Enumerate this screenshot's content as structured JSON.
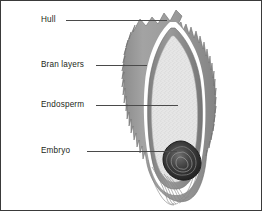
{
  "figure": {
    "frame_color": "#3a3a3a",
    "background": "#ffffff"
  },
  "labels": [
    {
      "id": "hull",
      "text": "Hull"
    },
    {
      "id": "bran",
      "text": "Bran layers"
    },
    {
      "id": "endosperm",
      "text": "Endosperm"
    },
    {
      "id": "embryo",
      "text": "Embryo"
    }
  ],
  "diagram": {
    "parts": [
      {
        "name": "hull",
        "fill": "#9a9a9a",
        "description": "spiky outer husk"
      },
      {
        "name": "bran",
        "fill": "#8e8e8e",
        "description": "gray layer beneath hull"
      },
      {
        "name": "endosperm",
        "fill": "#e3e3e3",
        "description": "large speckled light gray interior"
      },
      {
        "name": "embryo",
        "fill": "#2b2b2b",
        "description": "dark oval at base"
      }
    ],
    "colors": {
      "hull": "#9a9a9a",
      "hull_dark": "#7d7d7d",
      "gap": "#ffffff",
      "bran": "#8e8e8e",
      "endosperm": "#e3e3e3",
      "endosperm_speckle": "#c4c4c4",
      "embryo": "#2b2b2b",
      "embryo_mid": "#5a5a5a",
      "leader": "#4a4a4a",
      "text": "#231f20"
    }
  }
}
